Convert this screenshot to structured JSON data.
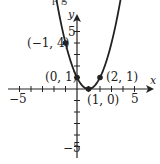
{
  "top_fragment": "p g",
  "chart_data": {
    "type": "line",
    "title": "",
    "equation": "y = (x - 1)^2",
    "xlabel": "x",
    "ylabel": "y",
    "xlim": [
      -6,
      6
    ],
    "ylim": [
      -6,
      6
    ],
    "x_ticks": [
      -5,
      -4,
      -3,
      -2,
      -1,
      1,
      2,
      3,
      4,
      5
    ],
    "y_ticks": [
      -5,
      -4,
      -3,
      -2,
      -1,
      1,
      2,
      3,
      4,
      5
    ],
    "x_tick_labels": {
      "-5": "−5",
      "5": "5"
    },
    "y_tick_labels": {
      "5": "5",
      "-5": "−5"
    },
    "points": [
      {
        "x": -1,
        "y": 4,
        "label": "(−1, 4)"
      },
      {
        "x": 0,
        "y": 1,
        "label": "(0, 1)"
      },
      {
        "x": 1,
        "y": 0,
        "label": "(1, 0)"
      },
      {
        "x": 2,
        "y": 1,
        "label": "(2, 1)"
      }
    ],
    "grid": false,
    "curve_arrows": true
  },
  "labels": {
    "x_axis": "x",
    "y_axis": "y",
    "xneg5": "−5",
    "xpos5": "5",
    "ypos5": "5",
    "yneg5": "−5",
    "p1": "(−1, 4)",
    "p2": "(0, 1)",
    "p3": "(1, 0)",
    "p4": "(2, 1)"
  },
  "colors": {
    "ink": "#222222",
    "background": "#ffffff"
  }
}
